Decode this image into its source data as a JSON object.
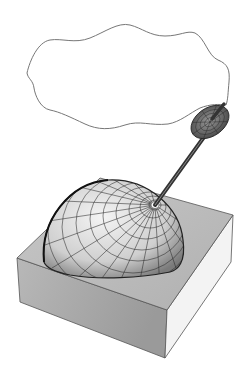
{
  "figure": {
    "colors": {
      "background": "#ffffff",
      "outline": "#555555",
      "box_top": "#bdbdbd",
      "box_front_left": "#a8a8a8",
      "box_front_right": "#f2f2f2",
      "sphere_fill": "#d9d9d9",
      "grid_line": "#2a2a2a",
      "rod": "#3a3a3a",
      "dish": "#6a6a6a"
    },
    "elements": {
      "wavy_outline": "wave-boundary",
      "block": "square-block",
      "hemisphere": "gridded-hemisphere",
      "rod": "antenna-rod",
      "dish": "gridded-dish"
    }
  }
}
